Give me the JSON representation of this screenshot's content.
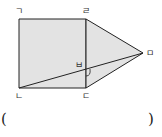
{
  "figure": {
    "fill_color": "#e3e3e3",
    "stroke_color": "#222222",
    "points": {
      "g": {
        "label": "ㄱ",
        "x": 19,
        "y": 19
      },
      "r": {
        "label": "ㄹ",
        "x": 86,
        "y": 19
      },
      "d": {
        "label": "ㄷ",
        "x": 86,
        "y": 88
      },
      "n": {
        "label": "ㄴ",
        "x": 19,
        "y": 88
      },
      "m": {
        "label": "ㅁ",
        "x": 143,
        "y": 53
      },
      "b": {
        "label": "ㅂ",
        "x": 86,
        "y": 70
      }
    },
    "shapes": [
      "square ㄱㄴㄷㄹ",
      "triangle ㄹㄷㅁ",
      "segment ㄴㅁ"
    ],
    "angle_marker_at": "ㅂ"
  },
  "answer": {
    "open": "(",
    "close": ")",
    "value": ""
  }
}
